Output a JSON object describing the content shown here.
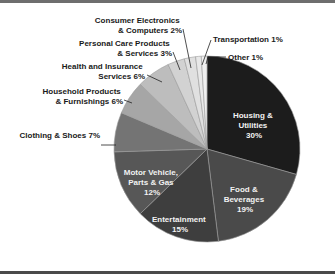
{
  "chart_data": {
    "type": "pie",
    "title": "",
    "start_angle": "12 o'clock",
    "direction": "clockwise",
    "categories": [
      "Housing & Utilities",
      "Food & Beverages",
      "Entertainment",
      "Motor Vehicle, Parts & Gas",
      "Clothing & Shoes",
      "Household Products & Furnishings",
      "Health and Insurance Services",
      "Personal Care Products & Services",
      "Consumer Electronics & Computers",
      "Transportation",
      "Other"
    ],
    "values": [
      30,
      19,
      15,
      12,
      7,
      6,
      6,
      3,
      2,
      1,
      1
    ],
    "unit": "%",
    "colors": [
      "#1c1c1c",
      "#4a4a4a",
      "#3e3e3e",
      "#575757",
      "#747474",
      "#a6a6a6",
      "#bdbdbd",
      "#d2d2d2",
      "#e0e0e0",
      "#e8e8e8",
      "#efefef"
    ],
    "legend": "none (direct labels)"
  },
  "labels": {
    "housing": [
      "Housing &",
      "Utilities",
      "30%"
    ],
    "food": [
      "Food &",
      "Beverages",
      "19%"
    ],
    "entertainment": [
      "Entertainment",
      "15%"
    ],
    "motor": [
      "Motor Vehicle,",
      "Parts & Gas",
      "12%"
    ],
    "clothing": [
      "Clothing & Shoes 7%"
    ],
    "household": [
      "Household Products",
      "& Furnishings 6%"
    ],
    "health": [
      "Health and Insurance",
      "Services 6%"
    ],
    "personal": [
      "Personal Care Products",
      "& Services 3%"
    ],
    "electronics": [
      "Consumer Electronics",
      "& Computers 2%"
    ],
    "transportation": [
      "Transportation 1%"
    ],
    "other": [
      "Other 1%"
    ]
  }
}
